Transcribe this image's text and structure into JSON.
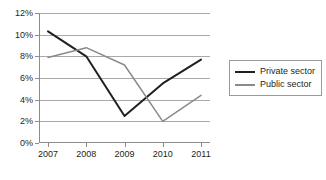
{
  "chart_data": {
    "type": "line",
    "title": "",
    "xlabel": "",
    "ylabel": "",
    "categories": [
      "2007",
      "2008",
      "2009",
      "2010",
      "2011"
    ],
    "x": [
      2007,
      2008,
      2009,
      2010,
      2011
    ],
    "ylim": [
      0,
      12
    ],
    "ytick_values": [
      12,
      10,
      8,
      6,
      4,
      2,
      0
    ],
    "ytick_labels": [
      "12%",
      "10%",
      "8%",
      "6%",
      "4%",
      "2%",
      "0%"
    ],
    "grid": "horizontal",
    "legend_position": "right",
    "series": [
      {
        "name": "Private sector",
        "color": "#231f20",
        "values": [
          10.3,
          8.0,
          2.5,
          5.5,
          7.7
        ]
      },
      {
        "name": "Public sector",
        "color": "#8a8a8a",
        "values": [
          7.9,
          8.8,
          7.2,
          2.0,
          4.4
        ]
      }
    ]
  },
  "legend": {
    "items": [
      {
        "label": "Private sector",
        "color": "#231f20"
      },
      {
        "label": "Public sector",
        "color": "#8a8a8a"
      }
    ]
  },
  "caption": {
    "text": ""
  }
}
